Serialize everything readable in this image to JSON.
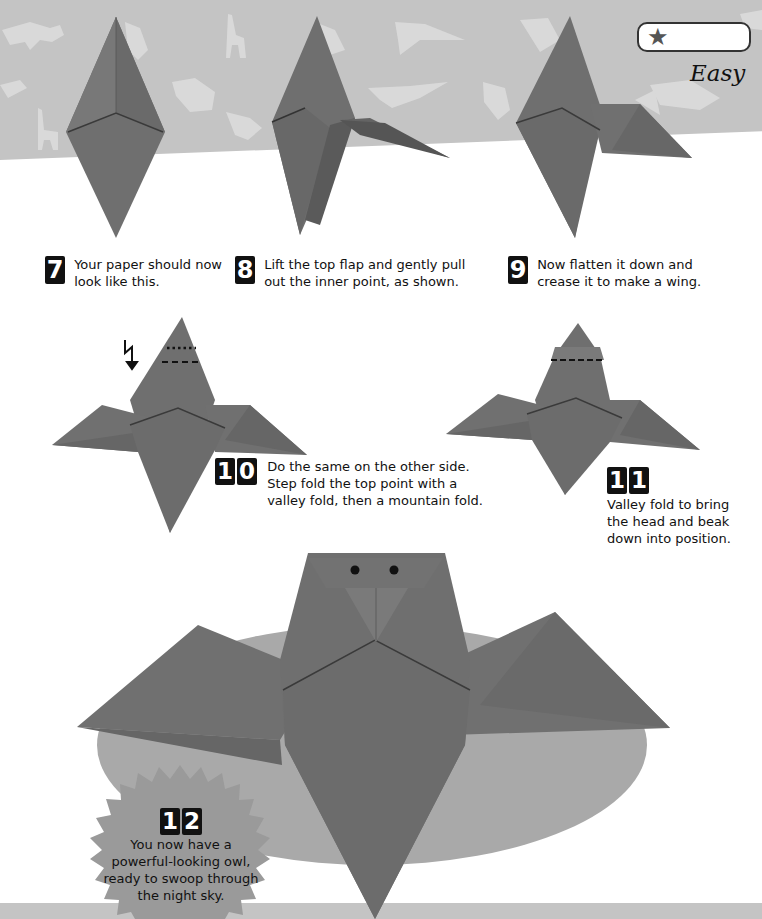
{
  "difficulty": {
    "star_icon": "star-icon",
    "stars": 1,
    "label": "Easy"
  },
  "steps": [
    {
      "number": "7",
      "digits": [
        "7"
      ],
      "text_lines": [
        "Your paper should now",
        "look like this."
      ]
    },
    {
      "number": "8",
      "digits": [
        "8"
      ],
      "text_lines": [
        "Lift the top flap and gently pull",
        "out the inner point, as shown."
      ]
    },
    {
      "number": "9",
      "digits": [
        "9"
      ],
      "text_lines": [
        "Now flatten it down and",
        "crease it to make a wing."
      ]
    },
    {
      "number": "10",
      "digits": [
        "1",
        "0"
      ],
      "text_lines": [
        "Do the same on the other side.",
        "Step fold the top point with a",
        "valley fold, then a mountain fold."
      ]
    },
    {
      "number": "11",
      "digits": [
        "1",
        "1"
      ],
      "text_lines": [
        "Valley fold to bring",
        "the head and beak",
        "down into position."
      ]
    },
    {
      "number": "12",
      "digits": [
        "1",
        "2"
      ],
      "text_lines": [
        "You now have a",
        "powerful-looking owl,",
        "ready to swoop through",
        "the night sky."
      ]
    }
  ],
  "colors": {
    "band": "#c4c4c4",
    "paper": "#6f6f6f",
    "paper_dark": "#5a5a5a",
    "paper_light": "#808080",
    "ellipse": "#a9a9a9",
    "burst": "#9a9a9a",
    "silhouette": "#dcdcdc"
  }
}
